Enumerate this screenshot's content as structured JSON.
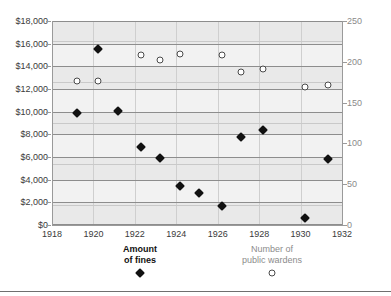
{
  "chart_data": {
    "type": "scatter",
    "title": "",
    "subtitle": "",
    "xlabel": "",
    "ylabel": "",
    "y2label": "",
    "grid": true,
    "legend_position": "bottom",
    "xlim": [
      1918,
      1932
    ],
    "xticks": [
      "1918",
      "1920",
      "1922",
      "1924",
      "1926",
      "1928",
      "1930",
      "1932"
    ],
    "xtick_values": [
      1918,
      1920,
      1922,
      1924,
      1926,
      1928,
      1930,
      1932
    ],
    "ylim": [
      0,
      18000
    ],
    "yticks": [
      "$0",
      "$2,000",
      "$4,000",
      "$6,000",
      "$8,000",
      "$10,000",
      "$12,000",
      "$14,000",
      "$16,000",
      "$18,000"
    ],
    "ytick_values": [
      0,
      2000,
      4000,
      6000,
      8000,
      10000,
      12000,
      14000,
      16000,
      18000
    ],
    "y2lim": [
      0,
      250
    ],
    "y2ticks": [
      "0",
      "50",
      "100",
      "150",
      "200",
      "250"
    ],
    "y2tick_values": [
      0,
      50,
      100,
      150,
      200,
      250
    ],
    "y2minor_values": [
      25,
      75,
      125,
      175,
      225
    ],
    "series": [
      {
        "name": "Amount of fines",
        "marker": "filled-diamond",
        "color": "#111111",
        "axis": "left",
        "points": [
          {
            "x": 1919.2,
            "y": 9850
          },
          {
            "x": 1920.2,
            "y": 15500
          },
          {
            "x": 1921.2,
            "y": 10050
          },
          {
            "x": 1922.3,
            "y": 6850
          },
          {
            "x": 1923.2,
            "y": 5900
          },
          {
            "x": 1924.2,
            "y": 3450
          },
          {
            "x": 1925.1,
            "y": 2850
          },
          {
            "x": 1926.2,
            "y": 1650
          },
          {
            "x": 1927.1,
            "y": 7750
          },
          {
            "x": 1928.2,
            "y": 8400
          },
          {
            "x": 1930.2,
            "y": 600
          },
          {
            "x": 1931.3,
            "y": 5850
          }
        ]
      },
      {
        "name": "Number of public wardens",
        "marker": "open-circle",
        "color": "#4a4a4a",
        "axis": "right",
        "points": [
          {
            "x": 1919.2,
            "y": 177
          },
          {
            "x": 1920.2,
            "y": 176
          },
          {
            "x": 1922.3,
            "y": 208
          },
          {
            "x": 1923.2,
            "y": 202
          },
          {
            "x": 1924.2,
            "y": 209
          },
          {
            "x": 1926.2,
            "y": 208
          },
          {
            "x": 1927.1,
            "y": 188
          },
          {
            "x": 1928.2,
            "y": 191
          },
          {
            "x": 1930.2,
            "y": 169
          },
          {
            "x": 1931.3,
            "y": 171
          }
        ]
      }
    ]
  },
  "legend": {
    "fines": {
      "line1": "Amount",
      "line2": "of fines",
      "marker": "filled-diamond-icon"
    },
    "wardens": {
      "line1": "Number of",
      "line2": "public wardens",
      "marker": "open-circle-icon"
    }
  },
  "colors": {
    "plot_background": "#e9e9e9",
    "band_background": "#f2f2f2",
    "gridline": "#8d8d8d",
    "gridline_minor": "#c9c9c9",
    "axis": "#9a9a9a",
    "left_axis_text": "#3a3a3a",
    "right_axis_text": "#8a8a8a",
    "fines_marker": "#111111",
    "wardens_marker": "#4a4a4a"
  }
}
